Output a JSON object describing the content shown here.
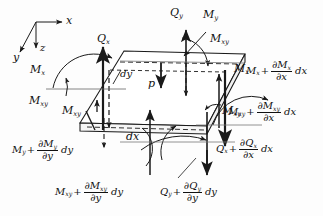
{
  "figure": {
    "type": "free-body-diagram",
    "stroke_color": "#1a1a1a",
    "background": "#fdfdfd"
  },
  "axes": {
    "x": "x",
    "y": "y",
    "z": "z"
  },
  "element": {
    "dx": "dx",
    "dy": "dy",
    "pressure": "p"
  },
  "labels": {
    "Qx": {
      "sym": "Q",
      "sub": "x"
    },
    "Qy": {
      "sym": "Q",
      "sub": "y"
    },
    "Mx": {
      "sym": "M",
      "sub": "x"
    },
    "My": {
      "sym": "M",
      "sub": "y"
    },
    "Mxy_left": {
      "sym": "M",
      "sub": "xy"
    },
    "Mxy_top": {
      "sym": "M",
      "sub": "xy"
    },
    "Mxy_bottomleft": {
      "sym": "M",
      "sub": "xy"
    },
    "Mx_right": {
      "sym": "M",
      "sub": "x"
    },
    "Mxy_right_face": {
      "sym": "M",
      "sub": "xy"
    }
  },
  "expressions": {
    "Mx_plus": {
      "base": "M",
      "base_sub": "x",
      "num": "∂M",
      "num_sub": "x",
      "den": "∂x",
      "diff": "dx"
    },
    "Mxy_plus_dx": {
      "base": "M",
      "base_sub": "xy",
      "num": "∂M",
      "num_sub": "xy",
      "den": "∂x",
      "diff": "dx"
    },
    "Qx_plus_dx": {
      "base": "Q",
      "base_sub": "x",
      "num": "∂Q",
      "num_sub": "x",
      "den": "∂x",
      "diff": "dx"
    },
    "My_plus_dy": {
      "base": "M",
      "base_sub": "y",
      "num": "∂M",
      "num_sub": "y",
      "den": "∂y",
      "diff": "dy"
    },
    "Mxy_plus_dy": {
      "base": "M",
      "base_sub": "xy",
      "num": "∂M",
      "num_sub": "xy",
      "den": "∂y",
      "diff": "dy"
    },
    "Qy_plus_dy": {
      "base": "Q",
      "base_sub": "y",
      "num": "∂Q",
      "num_sub": "y",
      "den": "∂y",
      "diff": "dy"
    }
  }
}
